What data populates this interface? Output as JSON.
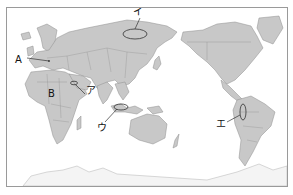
{
  "map": {
    "type": "world map (Pacific-centered)",
    "colors": {
      "land": "#c8c8c8",
      "sea": "#ffffff",
      "border": "#8e8e8e",
      "frame": "#9a9a9a"
    },
    "labels": [
      {
        "id": "A",
        "text": "A",
        "target": "Central Europe (Alps region)"
      },
      {
        "id": "B",
        "text": "B",
        "target": "Central Africa"
      },
      {
        "id": "a",
        "text": "ア",
        "target": "Persian Gulf region"
      },
      {
        "id": "i",
        "text": "イ",
        "target": "Siberia (ellipse)"
      },
      {
        "id": "u",
        "text": "ウ",
        "target": "Borneo / Southeast Asia (ellipse)"
      },
      {
        "id": "e",
        "text": "エ",
        "target": "Andes, South America (ellipse)"
      }
    ]
  }
}
